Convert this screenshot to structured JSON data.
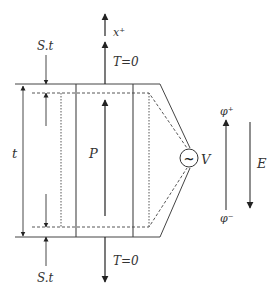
{
  "diagram": {
    "labels": {
      "x_plus": "x⁺",
      "t_top": "T=0",
      "t_bottom": "T=0",
      "st_top": "S.t",
      "st_bottom": "S.t",
      "thickness": "t",
      "polarization": "P",
      "voltage": "V",
      "phi_plus": "φ⁺",
      "phi_minus": "φ⁻",
      "field": "E",
      "source_symbol": "~"
    },
    "colors": {
      "line": "#333333",
      "background": "#ffffff"
    }
  }
}
